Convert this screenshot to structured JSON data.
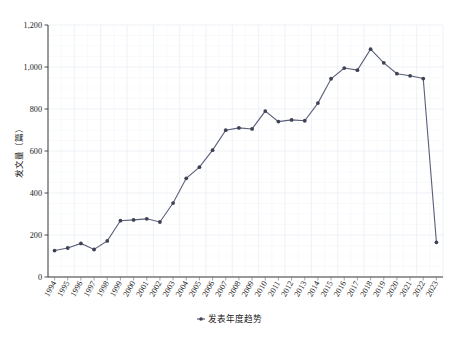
{
  "chart_data": {
    "type": "line",
    "title": "",
    "xlabel": "",
    "ylabel": "发文量（篇）",
    "legend": [
      "发表年度趋势"
    ],
    "legend_position": "bottom-center",
    "grid": true,
    "ylim": [
      0,
      1200
    ],
    "yticks": [
      0,
      200,
      400,
      600,
      800,
      1000,
      1200
    ],
    "ytick_labels": [
      "0",
      "200",
      "400",
      "600",
      "800",
      "1,000",
      "1,200"
    ],
    "categories": [
      "1994",
      "1995",
      "1996",
      "1997",
      "1998",
      "1999",
      "2000",
      "2001",
      "2002",
      "2003",
      "2004",
      "2005",
      "2006",
      "2007",
      "2008",
      "2009",
      "2010",
      "2011",
      "2012",
      "2013",
      "2014",
      "2015",
      "2016",
      "2017",
      "2018",
      "2019",
      "2020",
      "2021",
      "2022",
      "2023"
    ],
    "series": [
      {
        "name": "发表年度趋势",
        "color": "#5a5f78",
        "marker_color": "#3f4257",
        "values": [
          126,
          138,
          160,
          131,
          172,
          268,
          272,
          277,
          262,
          352,
          470,
          523,
          604,
          699,
          710,
          705,
          790,
          740,
          748,
          744,
          828,
          944,
          995,
          985,
          1085,
          1020,
          968,
          958,
          945,
          165
        ]
      }
    ]
  },
  "axis": {
    "y_title": "发文量（篇）"
  },
  "legend": {
    "items": [
      {
        "label": "发表年度趋势",
        "marker": "line-with-dot-marker",
        "color": "#3f4257"
      }
    ]
  }
}
